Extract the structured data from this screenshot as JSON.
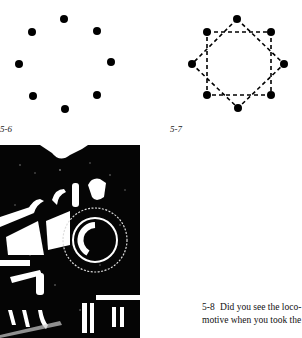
{
  "figures": {
    "fig_5_6": {
      "label": "5-6",
      "dot_color": "#000000",
      "dots": [
        [
          64,
          19
        ],
        [
          32,
          32
        ],
        [
          97,
          31
        ],
        [
          19,
          64
        ],
        [
          111,
          62
        ],
        [
          33,
          96
        ],
        [
          97,
          95
        ],
        [
          65,
          109
        ]
      ]
    },
    "fig_5_7": {
      "label": "5-7",
      "dot_color": "#000000",
      "dots": [
        [
          237,
          19
        ],
        [
          207,
          32
        ],
        [
          271,
          32
        ],
        [
          192,
          64
        ],
        [
          284,
          64
        ],
        [
          207,
          95
        ],
        [
          271,
          95
        ],
        [
          238,
          108
        ]
      ]
    },
    "fig_5_8": {
      "caption_number": "5-8",
      "caption_line1": "Did you see the loco-",
      "caption_line2": "motive when you took the",
      "image_description": "high-contrast black and white locomotive illustration"
    }
  }
}
